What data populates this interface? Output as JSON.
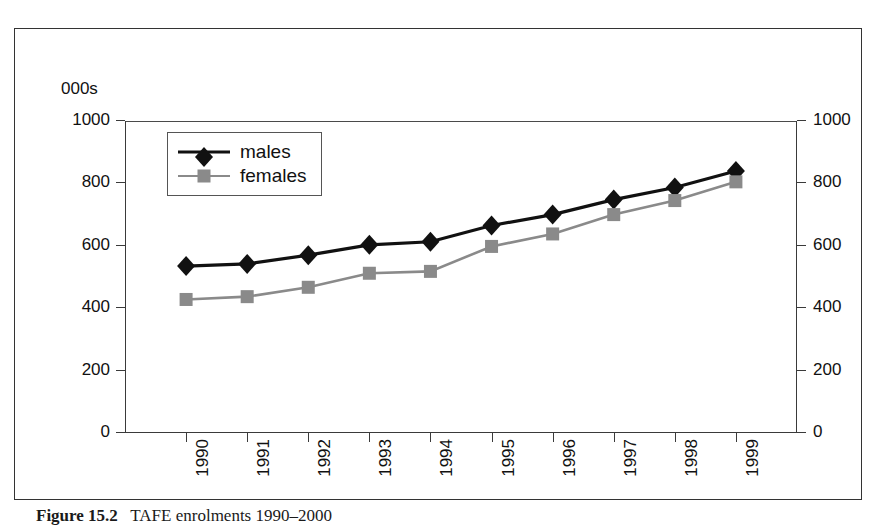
{
  "figure": {
    "units_label": "000s",
    "caption_label": "Figure 15.2",
    "caption_text": "TAFE enrolments 1990–2000"
  },
  "legend": {
    "position": "inside-top-left",
    "entries": [
      {
        "label": "males",
        "color": "#111111",
        "marker": "diamond"
      },
      {
        "label": "females",
        "color": "#8a8a8a",
        "marker": "square"
      }
    ]
  },
  "axes": {
    "y_left_ticks": [
      "0",
      "200",
      "400",
      "600",
      "800",
      "1000"
    ],
    "y_right_ticks": [
      "0",
      "200",
      "400",
      "600",
      "800",
      "1000"
    ],
    "x_ticks": [
      "1990",
      "1991",
      "1992",
      "1993",
      "1994",
      "1995",
      "1996",
      "1997",
      "1998",
      "1999"
    ]
  },
  "chart_data": {
    "type": "line",
    "title": "",
    "subtitle": "",
    "xlabel": "",
    "ylabel": "000s",
    "ylim": [
      0,
      1000
    ],
    "ytick_interval": 200,
    "grid": false,
    "dual_axis": true,
    "legend_position": "inside-top-left",
    "categories": [
      "1990",
      "1991",
      "1992",
      "1993",
      "1994",
      "1995",
      "1996",
      "1997",
      "1998",
      "1999"
    ],
    "series": [
      {
        "name": "males",
        "color": "#111111",
        "marker": "diamond",
        "values": [
          535,
          542,
          570,
          603,
          613,
          665,
          700,
          748,
          787,
          840
        ]
      },
      {
        "name": "females",
        "color": "#8a8a8a",
        "marker": "square",
        "values": [
          428,
          437,
          467,
          512,
          518,
          598,
          638,
          700,
          745,
          805
        ]
      }
    ]
  }
}
